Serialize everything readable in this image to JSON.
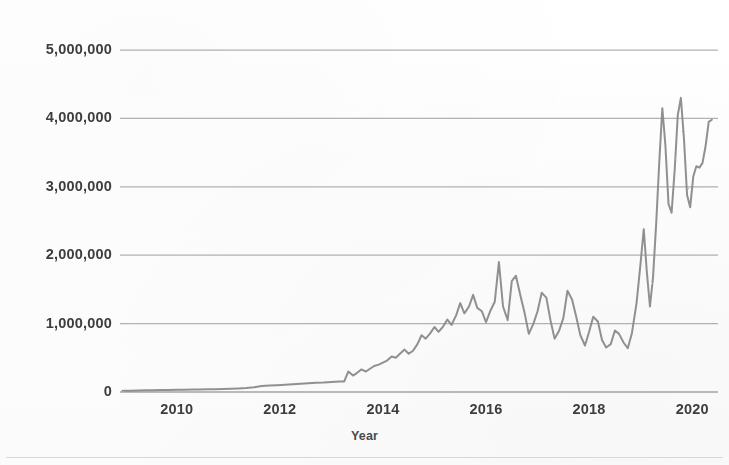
{
  "figure": {
    "background_color": "#fefefe",
    "line_color": "#8a8a8a",
    "grid_color": "#9d9d9d",
    "text_color": "#3d3d3d"
  },
  "axes": {
    "x_title": "Year",
    "y_title": "",
    "x_tick_labels": [
      "2010",
      "2012",
      "2014",
      "2016",
      "2018",
      "2020"
    ],
    "y_tick_labels": [
      "0",
      "1,000,000",
      "2,000,000",
      "3,000,000",
      "4,000,000",
      "5,000,000"
    ]
  },
  "chart_data": {
    "type": "line",
    "title": "",
    "subtitle": "",
    "xlabel": "Year",
    "ylabel": "",
    "xlim": [
      2008.9,
      2020.5
    ],
    "ylim": [
      0,
      5000000
    ],
    "xticks": [
      2010,
      2012,
      2014,
      2016,
      2018,
      2020
    ],
    "yticks": [
      0,
      1000000,
      2000000,
      3000000,
      4000000,
      5000000
    ],
    "ytick_labels": [
      "0",
      "1,000,000",
      "2,000,000",
      "3,000,000",
      "4,000,000",
      "5,000,000"
    ],
    "xtick_labels": [
      "2010",
      "2012",
      "2014",
      "2016",
      "2018",
      "2020"
    ],
    "grid": true,
    "grid_axis": "y",
    "legend": false,
    "legend_position": "none",
    "series": [
      {
        "name": "value",
        "color": "#8a8a8a",
        "line_width": 2,
        "x": [
          2008.95,
          2009.1,
          2009.25,
          2009.4,
          2009.55,
          2009.7,
          2009.85,
          2010.0,
          2010.15,
          2010.3,
          2010.45,
          2010.6,
          2010.75,
          2010.9,
          2011.05,
          2011.2,
          2011.35,
          2011.5,
          2011.65,
          2011.8,
          2011.95,
          2012.1,
          2012.25,
          2012.4,
          2012.55,
          2012.7,
          2012.85,
          2013.0,
          2013.08,
          2013.16,
          2013.25,
          2013.33,
          2013.42,
          2013.5,
          2013.58,
          2013.67,
          2013.75,
          2013.83,
          2013.92,
          2014.0,
          2014.08,
          2014.17,
          2014.25,
          2014.33,
          2014.42,
          2014.5,
          2014.58,
          2014.67,
          2014.75,
          2014.83,
          2014.92,
          2015.0,
          2015.08,
          2015.17,
          2015.25,
          2015.33,
          2015.42,
          2015.5,
          2015.58,
          2015.67,
          2015.75,
          2015.83,
          2015.92,
          2016.0,
          2016.08,
          2016.17,
          2016.25,
          2016.33,
          2016.42,
          2016.5,
          2016.58,
          2016.67,
          2016.75,
          2016.83,
          2016.92,
          2017.0,
          2017.08,
          2017.17,
          2017.25,
          2017.33,
          2017.42,
          2017.5,
          2017.58,
          2017.67,
          2017.75,
          2017.83,
          2017.92,
          2018.0,
          2018.08,
          2018.17,
          2018.25,
          2018.33,
          2018.42,
          2018.5,
          2018.58,
          2018.67,
          2018.75,
          2018.83,
          2018.92,
          2019.0,
          2019.06,
          2019.12,
          2019.18,
          2019.24,
          2019.3,
          2019.36,
          2019.42,
          2019.48,
          2019.54,
          2019.6,
          2019.66,
          2019.72,
          2019.78,
          2019.84,
          2019.9,
          2019.96,
          2020.02,
          2020.08,
          2020.14,
          2020.2,
          2020.26,
          2020.32,
          2020.38
        ],
        "y": [
          18000,
          20000,
          22000,
          24000,
          26000,
          28000,
          30000,
          32000,
          34000,
          36000,
          38000,
          40000,
          42000,
          45000,
          48000,
          52000,
          58000,
          70000,
          88000,
          95000,
          100000,
          105000,
          112000,
          120000,
          128000,
          135000,
          140000,
          148000,
          150000,
          152000,
          155000,
          300000,
          240000,
          280000,
          330000,
          300000,
          340000,
          380000,
          400000,
          430000,
          460000,
          520000,
          500000,
          560000,
          620000,
          560000,
          600000,
          700000,
          830000,
          780000,
          860000,
          950000,
          880000,
          960000,
          1060000,
          980000,
          1120000,
          1300000,
          1150000,
          1250000,
          1420000,
          1230000,
          1180000,
          1020000,
          1180000,
          1320000,
          1900000,
          1250000,
          1050000,
          1620000,
          1700000,
          1400000,
          1150000,
          850000,
          1000000,
          1180000,
          1450000,
          1380000,
          1050000,
          780000,
          900000,
          1080000,
          1480000,
          1350000,
          1100000,
          830000,
          680000,
          880000,
          1100000,
          1030000,
          760000,
          650000,
          700000,
          900000,
          850000,
          720000,
          640000,
          860000,
          1300000,
          1900000,
          2380000,
          1750000,
          1250000,
          1680000,
          2450000,
          3350000,
          4150000,
          3600000,
          2750000,
          2620000,
          3250000,
          4050000,
          4300000,
          3700000,
          2880000,
          2700000,
          3150000,
          3300000,
          3280000,
          3350000,
          3600000,
          3950000,
          3980000
        ]
      }
    ]
  }
}
